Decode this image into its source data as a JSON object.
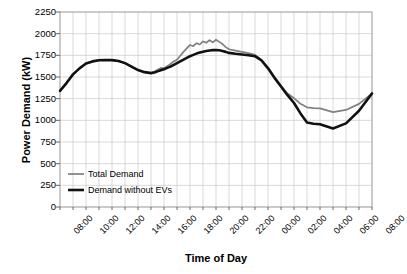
{
  "chart_data": {
    "type": "line",
    "title": "",
    "xlabel": "Time of Day",
    "ylabel": "Power Demand (kW)",
    "ylim": [
      0,
      2250
    ],
    "ytick_labels": [
      "2250",
      "2000",
      "1750",
      "1500",
      "1250",
      "1000",
      "750",
      "500",
      "250",
      "0"
    ],
    "ytick_values": [
      2250,
      2000,
      1750,
      1500,
      1250,
      1000,
      750,
      500,
      250,
      0
    ],
    "xtick_labels": [
      "08:00",
      "10:00",
      "12:00",
      "14:00",
      "16:00",
      "18:00",
      "20:00",
      "22:00",
      "00:00",
      "02:00",
      "04:00",
      "06:00",
      "08:00"
    ],
    "xtick_hours": [
      0,
      2,
      4,
      6,
      8,
      10,
      12,
      14,
      16,
      18,
      20,
      22,
      24
    ],
    "grid": true,
    "legend_position": "lower-left",
    "x": [
      0,
      0.5,
      1,
      1.5,
      2,
      2.5,
      3,
      3.5,
      4,
      4.5,
      5,
      5.5,
      6,
      6.5,
      7,
      7.25,
      7.5,
      7.75,
      8,
      8.25,
      8.5,
      8.75,
      9,
      9.25,
      9.5,
      9.75,
      10,
      10.25,
      10.5,
      10.75,
      11,
      11.25,
      11.5,
      11.75,
      12,
      12.25,
      12.5,
      12.75,
      13,
      13.5,
      14,
      14.5,
      15,
      15.5,
      16,
      16.5,
      17,
      17.5,
      18,
      18.5,
      19,
      19.5,
      20,
      20.5,
      21,
      21.5,
      22,
      22.5,
      23,
      23.5,
      24
    ],
    "series": [
      {
        "name": "Total Demand",
        "color": "#808080",
        "width": 1.7,
        "values": [
          1340,
          1430,
          1530,
          1600,
          1655,
          1680,
          1693,
          1697,
          1695,
          1685,
          1660,
          1620,
          1580,
          1556,
          1548,
          1562,
          1585,
          1605,
          1600,
          1625,
          1650,
          1680,
          1700,
          1745,
          1790,
          1830,
          1870,
          1855,
          1890,
          1875,
          1910,
          1895,
          1925,
          1900,
          1930,
          1905,
          1880,
          1845,
          1820,
          1805,
          1790,
          1775,
          1755,
          1700,
          1610,
          1500,
          1400,
          1310,
          1255,
          1190,
          1150,
          1140,
          1138,
          1140,
          1140,
          1135,
          1125,
          1105,
          1085,
          1075,
          1080
        ]
      },
      {
        "name": "Demand without EVs",
        "color": "#111111",
        "width": 2.6,
        "values": [
          1340,
          1430,
          1530,
          1600,
          1655,
          1680,
          1693,
          1697,
          1695,
          1685,
          1660,
          1620,
          1580,
          1556,
          1545,
          1552,
          1565,
          1578,
          1590,
          1605,
          1620,
          1640,
          1660,
          1680,
          1700,
          1720,
          1740,
          1755,
          1770,
          1782,
          1792,
          1800,
          1806,
          1810,
          1812,
          1808,
          1800,
          1790,
          1778,
          1768,
          1760,
          1750,
          1740,
          1690,
          1600,
          1490,
          1390,
          1290,
          1200,
          1080,
          975,
          960,
          955,
          935,
          915,
          895,
          880,
          870,
          868,
          872,
          880
        ]
      }
    ],
    "series_tail": {
      "note": "both series converge after 06:00",
      "x": [
        20,
        21,
        22,
        23,
        24
      ],
      "total": [
        1080,
        1095,
        1120,
        1190,
        1310
      ],
      "without_evs": [
        880,
        905,
        965,
        1110,
        1310
      ]
    }
  },
  "legend": {
    "items": [
      {
        "label": "Total Demand",
        "color": "#808080"
      },
      {
        "label": "Demand without EVs",
        "color": "#111111"
      }
    ]
  }
}
